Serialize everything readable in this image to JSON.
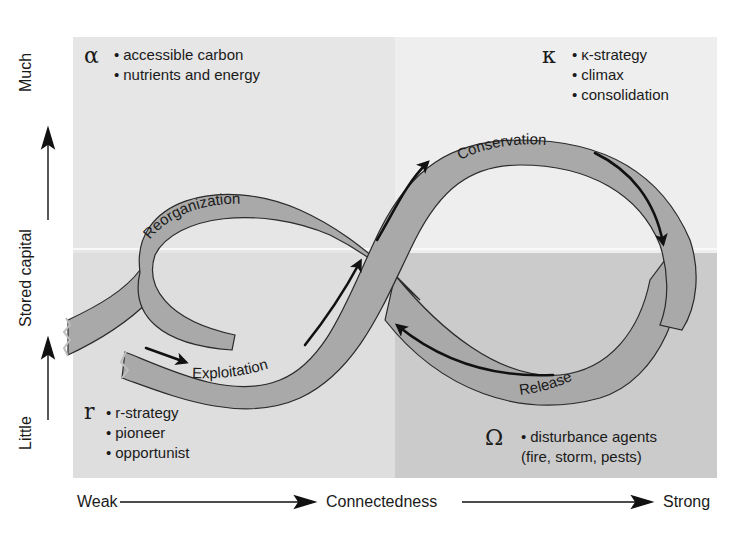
{
  "figure": {
    "colors": {
      "band_fill": "#a9a9a9",
      "band_stroke": "#2a2a2a",
      "arrow": "#111111",
      "quadrant_alpha": "#e6e6e6",
      "quadrant_kappa": "#eeeeee",
      "quadrant_r": "#dedede",
      "quadrant_omega": "#cbcbcb"
    }
  },
  "axes": {
    "y": {
      "low": "Little",
      "label": "Stored capital",
      "high": "Much"
    },
    "x": {
      "low": "Weak",
      "label": "Connectedness",
      "high": "Strong"
    }
  },
  "quadrants": {
    "alpha": {
      "symbol": "α",
      "items": [
        "accessible carbon",
        "nutrients and energy"
      ]
    },
    "kappa": {
      "symbol": "κ",
      "items": [
        "κ-strategy",
        "climax",
        "consolidation"
      ]
    },
    "r": {
      "symbol": "r",
      "items": [
        "r-strategy",
        "pioneer",
        "opportunist"
      ]
    },
    "omega": {
      "symbol": "Ω",
      "items": [
        "disturbance agents",
        "(fire, storm, pests)"
      ]
    }
  },
  "phases": {
    "reorganization": "Reorganization",
    "exploitation": "Exploitation",
    "conservation": "Conservation",
    "release": "Release"
  }
}
